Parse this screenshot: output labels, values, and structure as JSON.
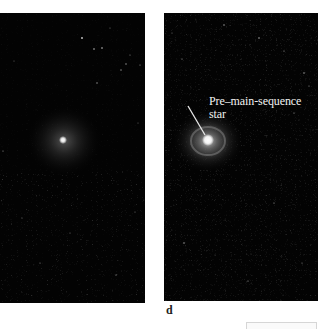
{
  "figure": {
    "panels": [
      {
        "id": "c",
        "label": "",
        "description": "Dark star field with a faint diffuse nebula surrounding a small bright point source"
      },
      {
        "id": "d",
        "label": "d",
        "description": "Dark star field with a brighter glowing star surrounded by a disk-like nebula",
        "annotation": {
          "line1": "Pre–main-sequence",
          "line2": "star"
        }
      }
    ],
    "colors": {
      "background": "#ffffff",
      "panel_background": "#030303",
      "annotation_text": "#f2f2f2",
      "pointer_line": "#e8e8e8",
      "label_text": "#222222"
    }
  }
}
